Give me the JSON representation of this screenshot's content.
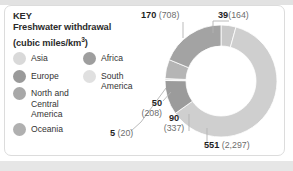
{
  "legend": {
    "heading": "KEY",
    "title_line1": "Freshwater withdrawal",
    "title_line2_pre": "(cubic miles/km",
    "title_line2_sup": "3",
    "title_line2_post": ")",
    "items": [
      {
        "label": "Asia",
        "color": "#d9d9d9",
        "column": "left"
      },
      {
        "label": "Europe",
        "color": "#9a9a9a",
        "column": "left"
      },
      {
        "label": "North and Central America",
        "color": "#a8a8a8",
        "column": "left"
      },
      {
        "label": "Oceania",
        "color": "#b0b0b0",
        "column": "left"
      },
      {
        "label": "Africa",
        "color": "#9e9e9e",
        "column": "right"
      },
      {
        "label": "South America",
        "color": "#e0e0e0",
        "column": "right"
      }
    ]
  },
  "callouts": {
    "c170": {
      "value": "170",
      "paren": "(708)"
    },
    "c39": {
      "value": "39",
      "paren": "(164)"
    },
    "c50": {
      "value": "50",
      "paren": "(208)"
    },
    "c5": {
      "value": "5",
      "paren": "(20)"
    },
    "c90": {
      "value": "90",
      "paren": "(337)"
    },
    "c551": {
      "value": "551",
      "paren": "(2,297)"
    }
  },
  "chart_data": {
    "type": "pie",
    "title": "Freshwater withdrawal (cubic miles/km3)",
    "unit_primary": "cubic miles",
    "unit_secondary": "km3",
    "categories": [
      "Oceania",
      "Asia",
      "North and Central America",
      "South America",
      "Africa",
      "Europe"
    ],
    "values": [
      39,
      551,
      90,
      5,
      50,
      170
    ],
    "values_km3": [
      164,
      2297,
      337,
      20,
      208,
      708
    ],
    "colors": [
      "#c9c9c9",
      "#cfcfcf",
      "#9b9b9b",
      "#e2e2e2",
      "#b5b5b5",
      "#a3a3a3"
    ],
    "labels": [
      "39 (164)",
      "551 (2,297)",
      "90 (337)",
      "5 (20)",
      "50 (208)",
      "170 (708)"
    ],
    "donut": true,
    "legend": "left",
    "grid": false
  }
}
